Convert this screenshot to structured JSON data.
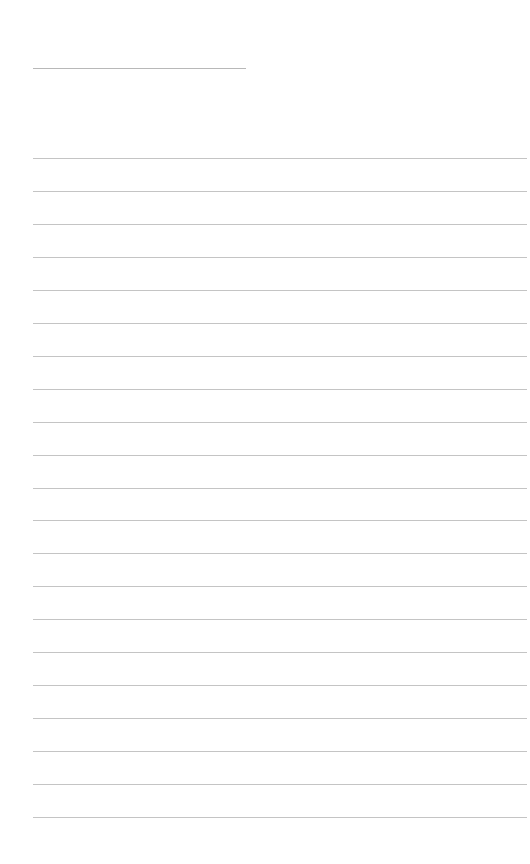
{
  "page": {
    "type": "blank-lined-sheet",
    "title_line": {
      "x": 33,
      "y": 68,
      "width": 213,
      "text": ""
    },
    "rules": {
      "count": 21,
      "start_y": 158,
      "spacing": 32.95,
      "x": 33,
      "width": 494,
      "color": "#c4c4c4"
    },
    "background_color": "#ffffff"
  }
}
